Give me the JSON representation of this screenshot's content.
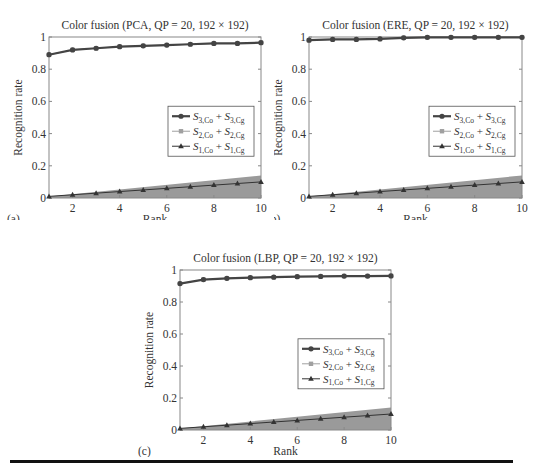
{
  "figure": {
    "bottom_rule": true
  },
  "legend_entries": [
    {
      "label_main": "S",
      "sub_a": "3,Co",
      "plus": "+",
      "label_b": "S",
      "sub_b": "3,Cg",
      "marker": "circle",
      "color": "#444444",
      "width": 2.2
    },
    {
      "label_main": "S",
      "sub_a": "2,Co",
      "plus": "+",
      "label_b": "S",
      "sub_b": "2,Cg",
      "marker": "square",
      "color": "#a0a0a0",
      "width": 1
    },
    {
      "label_main": "S",
      "sub_a": "1,Co",
      "plus": "+",
      "label_b": "S",
      "sub_b": "1,Cg",
      "marker": "triangle",
      "color": "#333333",
      "width": 1
    }
  ],
  "chart_data": [
    {
      "panel_label": "(a)",
      "type": "line",
      "title": "Color fusion (PCA, QP = 20, 192 × 192)",
      "xlabel": "Rank",
      "ylabel": "Recognition rate",
      "x": [
        1,
        2,
        3,
        4,
        5,
        6,
        7,
        8,
        9,
        10
      ],
      "xticks": [
        "2",
        "4",
        "6",
        "8",
        "10"
      ],
      "yticks": [
        "0",
        "0.2",
        "0.4",
        "0.6",
        "0.8",
        "1"
      ],
      "xlim": [
        1,
        10
      ],
      "ylim": [
        0,
        1
      ],
      "grid": false,
      "legend_position": "center-right",
      "series": [
        {
          "name": "S3,Co + S3,Cg",
          "values": [
            0.89,
            0.92,
            0.93,
            0.94,
            0.945,
            0.95,
            0.955,
            0.96,
            0.96,
            0.965
          ]
        },
        {
          "name": "S2,Co + S2,Cg",
          "values": [
            0.89,
            0.92,
            0.93,
            0.94,
            0.945,
            0.95,
            0.955,
            0.96,
            0.96,
            0.965
          ]
        },
        {
          "name": "S1,Co + S1,Cg",
          "values": [
            0.01,
            0.02,
            0.03,
            0.04,
            0.05,
            0.06,
            0.07,
            0.08,
            0.09,
            0.1
          ]
        }
      ],
      "shaded_region": {
        "x": [
          1,
          10
        ],
        "upper": [
          0.01,
          0.14
        ],
        "color": "#9a9a9a"
      }
    },
    {
      "panel_label": "(b)",
      "type": "line",
      "title": "Color fusion (ERE, QP = 20, 192 × 192)",
      "xlabel": "Rank",
      "ylabel": "Recognition rate",
      "x": [
        1,
        2,
        3,
        4,
        5,
        6,
        7,
        8,
        9,
        10
      ],
      "xticks": [
        "2",
        "4",
        "6",
        "8",
        "10"
      ],
      "yticks": [
        "0",
        "0.2",
        "0.4",
        "0.6",
        "0.8",
        "1"
      ],
      "xlim": [
        1,
        10
      ],
      "ylim": [
        0,
        1
      ],
      "grid": false,
      "legend_position": "center-right",
      "series": [
        {
          "name": "S3,Co + S3,Cg",
          "values": [
            0.98,
            0.985,
            0.985,
            0.988,
            0.995,
            0.998,
            0.998,
            0.998,
            0.998,
            0.998
          ]
        },
        {
          "name": "S2,Co + S2,Cg",
          "values": [
            0.98,
            0.985,
            0.985,
            0.988,
            0.995,
            0.998,
            0.998,
            0.998,
            0.998,
            0.998
          ]
        },
        {
          "name": "S1,Co + S1,Cg",
          "values": [
            0.01,
            0.02,
            0.03,
            0.04,
            0.05,
            0.06,
            0.07,
            0.08,
            0.09,
            0.1
          ]
        }
      ],
      "shaded_region": {
        "x": [
          1,
          10
        ],
        "upper": [
          0.01,
          0.14
        ],
        "color": "#9a9a9a"
      }
    },
    {
      "panel_label": "(c)",
      "type": "line",
      "title": "Color fusion (LBP, QP = 20, 192 × 192)",
      "xlabel": "Rank",
      "ylabel": "Recognition rate",
      "x": [
        1,
        2,
        3,
        4,
        5,
        6,
        7,
        8,
        9,
        10
      ],
      "xticks": [
        "2",
        "4",
        "6",
        "8",
        "10"
      ],
      "yticks": [
        "0",
        "0.2",
        "0.4",
        "0.6",
        "0.8",
        "1"
      ],
      "xlim": [
        1,
        10
      ],
      "ylim": [
        0,
        1
      ],
      "grid": false,
      "legend_position": "center-right",
      "series": [
        {
          "name": "S3,Co + S3,Cg",
          "values": [
            0.915,
            0.94,
            0.948,
            0.952,
            0.955,
            0.958,
            0.96,
            0.962,
            0.962,
            0.963
          ]
        },
        {
          "name": "S2,Co + S2,Cg",
          "values": [
            0.915,
            0.94,
            0.948,
            0.952,
            0.955,
            0.958,
            0.96,
            0.962,
            0.962,
            0.963
          ]
        },
        {
          "name": "S1,Co + S1,Cg",
          "values": [
            0.01,
            0.02,
            0.03,
            0.04,
            0.05,
            0.06,
            0.07,
            0.08,
            0.09,
            0.1
          ]
        }
      ],
      "shaded_region": {
        "x": [
          1,
          10
        ],
        "upper": [
          0.01,
          0.14
        ],
        "color": "#9a9a9a"
      }
    }
  ]
}
